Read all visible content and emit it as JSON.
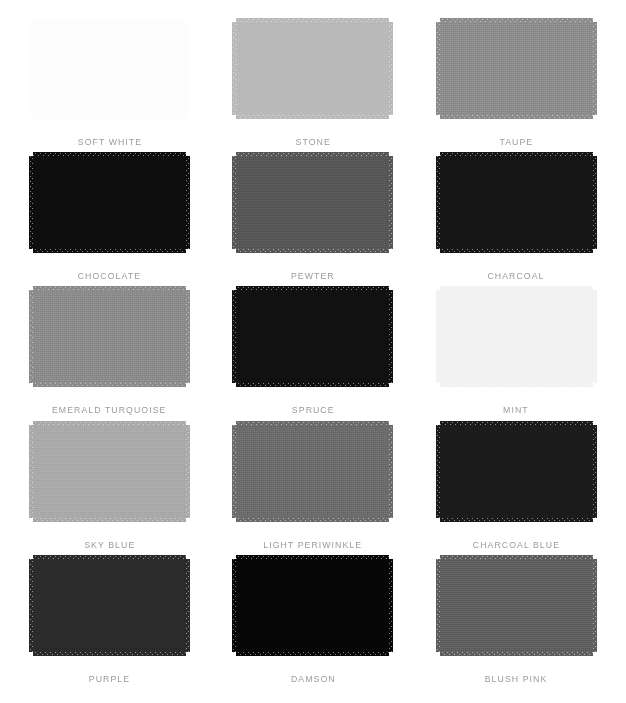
{
  "palette": {
    "columns": 3,
    "rows": 5,
    "background_color": "#ffffff",
    "label_color": "#9a9a9a",
    "swatches": [
      {
        "label": "SOFT WHITE",
        "color": "#fdfdfd"
      },
      {
        "label": "STONE",
        "color": "#b9b9b9"
      },
      {
        "label": "TAUPE",
        "color": "#8c8c8c"
      },
      {
        "label": "CHOCOLATE",
        "color": "#0d0d0d"
      },
      {
        "label": "PEWTER",
        "color": "#565656"
      },
      {
        "label": "CHARCOAL",
        "color": "#161616"
      },
      {
        "label": "EMERALD TURQUOISE",
        "color": "#8b8b8b"
      },
      {
        "label": "SPRUCE",
        "color": "#111111"
      },
      {
        "label": "MINT",
        "color": "#f2f2f2"
      },
      {
        "label": "SKY BLUE",
        "color": "#a9a9a9"
      },
      {
        "label": "LIGHT PERIWINKLE",
        "color": "#6b6b6b"
      },
      {
        "label": "CHARCOAL BLUE",
        "color": "#1b1b1b"
      },
      {
        "label": "PURPLE",
        "color": "#2a2a2a"
      },
      {
        "label": "DAMSON",
        "color": "#060606"
      },
      {
        "label": "BLUSH PINK",
        "color": "#5e5e5e"
      }
    ]
  }
}
